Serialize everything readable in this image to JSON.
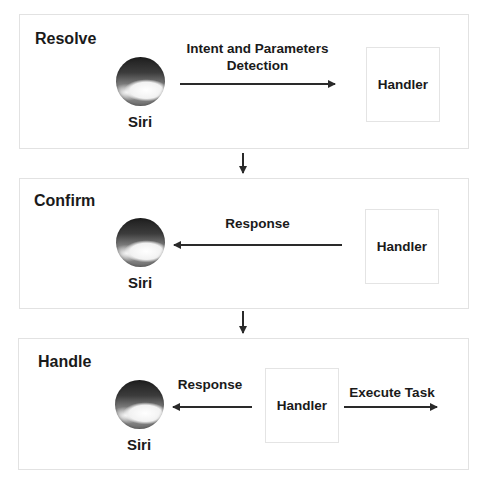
{
  "stages": [
    {
      "title": "Resolve",
      "siri_label": "Siri",
      "handler_label": "Handler",
      "arrow_label_line1": "Intent and Parameters",
      "arrow_label_line2": "Detection",
      "arrow_direction": "siri-to-handler"
    },
    {
      "title": "Confirm",
      "siri_label": "Siri",
      "handler_label": "Handler",
      "arrow_label": "Response",
      "arrow_direction": "handler-to-siri"
    },
    {
      "title": "Handle",
      "siri_label": "Siri",
      "handler_label": "Handler",
      "response_label": "Response",
      "execute_label": "Execute Task",
      "arrow_direction": "handler-to-siri-and-task"
    }
  ],
  "colors": {
    "border": "#e2e2e2",
    "text": "#1a1a1a",
    "arrow": "#2a2a2a"
  }
}
